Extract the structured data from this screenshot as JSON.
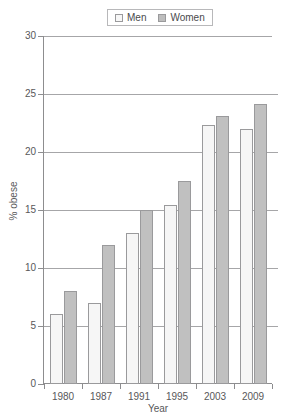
{
  "legend": {
    "entries": [
      {
        "label": "Men",
        "swatch": "men",
        "color": "#f6f6f6"
      },
      {
        "label": "Women",
        "swatch": "women",
        "color": "#c0c0c0"
      }
    ]
  },
  "axes": {
    "y_title": "% obese",
    "x_title": "Year",
    "y_ticks": [
      "0",
      "5",
      "10",
      "15",
      "20",
      "25",
      "30"
    ]
  },
  "chart_data": {
    "type": "bar",
    "title": "",
    "xlabel": "Year",
    "ylabel": "% obese",
    "categories": [
      "1980",
      "1987",
      "1991",
      "1995",
      "2003",
      "2009"
    ],
    "series": [
      {
        "name": "Men",
        "color": "#f6f6f6",
        "values": [
          6.0,
          7.0,
          13.0,
          15.4,
          22.3,
          22.0
        ]
      },
      {
        "name": "Women",
        "color": "#c0c0c0",
        "values": [
          8.0,
          12.0,
          15.0,
          17.5,
          23.1,
          24.1
        ]
      }
    ],
    "ylim": [
      0,
      30
    ],
    "ytick_step": 5,
    "grid": true,
    "legend_position": "top-center"
  }
}
